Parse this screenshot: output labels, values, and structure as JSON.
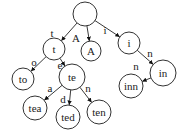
{
  "diagram": {
    "type": "trie",
    "nodes": [
      {
        "id": "root",
        "label": "",
        "x": 85,
        "y": 14,
        "r": 12
      },
      {
        "id": "t",
        "label": "t",
        "x": 54,
        "y": 49,
        "r": 11
      },
      {
        "id": "A",
        "label": "A",
        "x": 91,
        "y": 51,
        "r": 10
      },
      {
        "id": "i",
        "label": "i",
        "x": 129,
        "y": 43,
        "r": 11
      },
      {
        "id": "to",
        "label": "to",
        "x": 23,
        "y": 79,
        "r": 11
      },
      {
        "id": "te",
        "label": "te",
        "x": 72,
        "y": 77,
        "r": 13
      },
      {
        "id": "in",
        "label": "in",
        "x": 163,
        "y": 73,
        "r": 13
      },
      {
        "id": "inn",
        "label": "inn",
        "x": 131,
        "y": 86,
        "r": 12
      },
      {
        "id": "tea",
        "label": "tea",
        "x": 35,
        "y": 108,
        "r": 12
      },
      {
        "id": "ted",
        "label": "ted",
        "x": 68,
        "y": 117,
        "r": 12
      },
      {
        "id": "ten",
        "label": "ten",
        "x": 99,
        "y": 112,
        "r": 12
      }
    ],
    "edges": [
      {
        "from": "root",
        "to": "t",
        "label": "t",
        "lx": 52,
        "ly": 33
      },
      {
        "from": "root",
        "to": "A",
        "label": "A",
        "lx": 76,
        "ly": 38
      },
      {
        "from": "root",
        "to": "i",
        "label": "i",
        "lx": 105,
        "ly": 30
      },
      {
        "from": "t",
        "to": "to",
        "label": "o",
        "lx": 34,
        "ly": 62
      },
      {
        "from": "t",
        "to": "te",
        "label": "e",
        "lx": 60,
        "ly": 65
      },
      {
        "from": "te",
        "to": "tea",
        "label": "a",
        "lx": 50,
        "ly": 88
      },
      {
        "from": "te",
        "to": "ted",
        "label": "d",
        "lx": 63,
        "ly": 99
      },
      {
        "from": "te",
        "to": "ten",
        "label": "n",
        "lx": 88,
        "ly": 88
      },
      {
        "from": "i",
        "to": "in",
        "label": "n",
        "lx": 150,
        "ly": 53
      },
      {
        "from": "in",
        "to": "inn",
        "label": "n",
        "lx": 136,
        "ly": 66
      }
    ]
  }
}
